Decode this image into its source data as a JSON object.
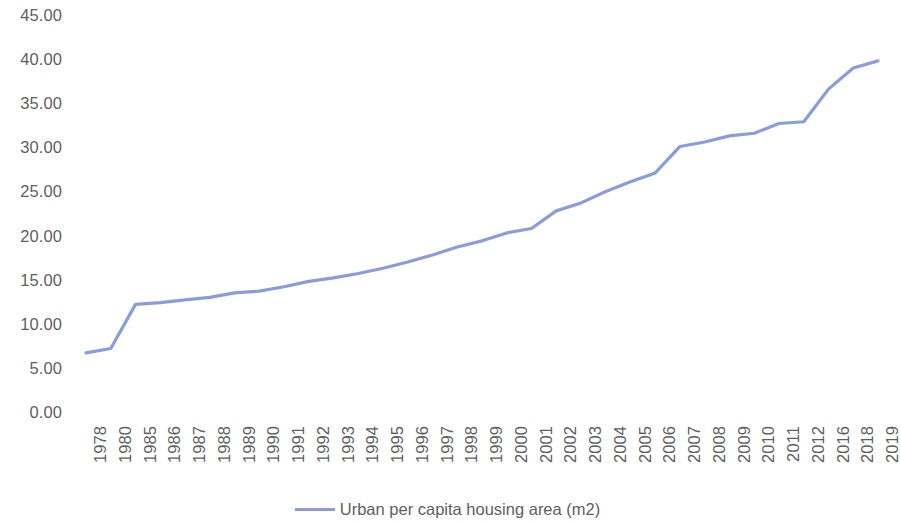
{
  "chart_data": {
    "type": "line",
    "title": "",
    "subtitle": "",
    "xlabel": "",
    "ylabel": "",
    "grid": false,
    "legend_position": "bottom-center",
    "series_color": "#8A9BDE",
    "ylim": [
      0,
      45
    ],
    "ytick_step": 5,
    "ytick_labels": [
      "45.00",
      "40.00",
      "35.00",
      "30.00",
      "25.00",
      "20.00",
      "15.00",
      "10.00",
      "5.00",
      "0.00"
    ],
    "ytick_values": [
      45,
      40,
      35,
      30,
      25,
      20,
      15,
      10,
      5,
      0
    ],
    "categories": [
      "1978",
      "1980",
      "1985",
      "1986",
      "1987",
      "1988",
      "1989",
      "1990",
      "1991",
      "1992",
      "1993",
      "1994",
      "1995",
      "1996",
      "1997",
      "1998",
      "1999",
      "2000",
      "2001",
      "2002",
      "2003",
      "2004",
      "2005",
      "2006",
      "2007",
      "2008",
      "2009",
      "2010",
      "2011",
      "2012",
      "2016",
      "2018",
      "2019"
    ],
    "series": [
      {
        "name": "Urban per capita housing area (m2)",
        "color": "#8A9BDE",
        "values": [
          6.7,
          7.2,
          12.2,
          12.4,
          12.7,
          13.0,
          13.5,
          13.7,
          14.2,
          14.8,
          15.2,
          15.7,
          16.3,
          17.0,
          17.8,
          18.7,
          19.4,
          20.3,
          20.8,
          22.8,
          23.7,
          25.0,
          26.1,
          27.1,
          30.1,
          30.6,
          31.3,
          31.6,
          32.7,
          32.9,
          36.6,
          39.0,
          39.8
        ]
      }
    ],
    "legend": [
      {
        "label": "Urban per capita housing area (m2)",
        "color": "#8A9BDE"
      }
    ]
  }
}
